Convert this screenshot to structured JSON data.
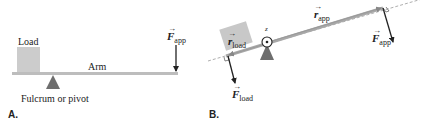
{
  "panel_a": {
    "letter": "A.",
    "load_label": "Load",
    "arm_label": "Arm",
    "fulcrum_label": "Fulcrum or pivot",
    "force": {
      "symbol": "F",
      "subscript": "app"
    }
  },
  "panel_b": {
    "letter": "B.",
    "axis_label": "z",
    "r_app": {
      "symbol": "r",
      "subscript": "app"
    },
    "r_load": {
      "symbol": "r",
      "subscript": "load"
    },
    "f_app": {
      "symbol": "F",
      "subscript": "app"
    },
    "f_load": {
      "symbol": "F",
      "subscript": "load"
    }
  },
  "colors": {
    "beam": "#b9b9b9",
    "load_box": "#c8c8c8",
    "fulcrum": "#707070",
    "arrow": "#222222",
    "dashed": "#999999"
  }
}
